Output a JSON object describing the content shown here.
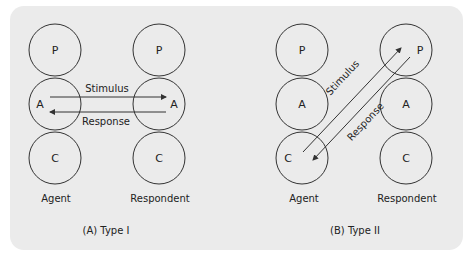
{
  "panels": [
    {
      "id": "type1",
      "caption": "(A) Type I",
      "agent": {
        "label": "Agent",
        "states": [
          "P",
          "A",
          "C"
        ]
      },
      "respondent": {
        "label": "Respondent",
        "states": [
          "P",
          "A",
          "C"
        ]
      },
      "stimulus_label": "Stimulus",
      "response_label": "Response",
      "transaction": {
        "stimulus": "A → A",
        "response": "A → A"
      }
    },
    {
      "id": "type2",
      "caption": "(B) Type II",
      "agent": {
        "label": "Agent",
        "states": [
          "P",
          "A",
          "C"
        ]
      },
      "respondent": {
        "label": "Respondent",
        "states": [
          "P",
          "A",
          "C"
        ]
      },
      "stimulus_label": "Stimulus",
      "response_label": "Response",
      "transaction": {
        "stimulus": "C → P",
        "response": "P → C"
      }
    }
  ],
  "colors": {
    "panel_bg": "#ebebeb",
    "stroke": "#333333",
    "background": "#ffffff"
  }
}
